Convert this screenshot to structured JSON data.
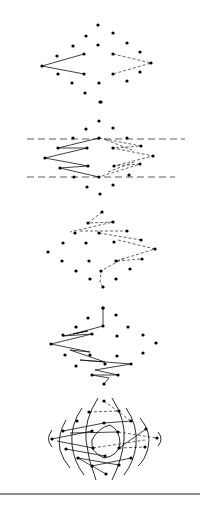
{
  "figure": {
    "dot_radius": 1.6,
    "ink_color": "#000000",
    "background": "#ffffff",
    "panels": [
      {
        "name": "panel-1",
        "dots": [
          [
            98,
            25
          ],
          [
            86,
            36
          ],
          [
            113,
            33
          ],
          [
            73,
            46
          ],
          [
            98,
            45
          ],
          [
            127,
            43
          ],
          [
            57,
            56
          ],
          [
            84,
            54
          ],
          [
            113,
            54
          ],
          [
            140,
            52
          ],
          [
            42,
            66
          ],
          [
            151,
            63
          ],
          [
            58,
            74
          ],
          [
            84,
            74
          ],
          [
            113,
            74
          ],
          [
            140,
            72
          ],
          [
            72,
            83
          ],
          [
            99,
            83
          ],
          [
            127,
            81
          ],
          [
            85,
            93
          ],
          [
            101,
            102
          ]
        ],
        "solid_paths": [
          [
            [
              84,
              54
            ],
            [
              42,
              66
            ],
            [
              84,
              74
            ]
          ]
        ],
        "dashed_paths": [
          [
            [
              113,
              54
            ],
            [
              151,
              63
            ],
            [
              113,
              74
            ]
          ]
        ],
        "long_dashed_lines": [],
        "arcs": []
      },
      {
        "name": "panel-2",
        "dots": [
          [
            100,
            102
          ],
          [
            99,
            121
          ],
          [
            86,
            129
          ],
          [
            113,
            128
          ],
          [
            73,
            138
          ],
          [
            99,
            138
          ],
          [
            127,
            138
          ],
          [
            58,
            148
          ],
          [
            87,
            148
          ],
          [
            113,
            148
          ],
          [
            141,
            146
          ],
          [
            45,
            158
          ],
          [
            153,
            156
          ],
          [
            60,
            168
          ],
          [
            88,
            166
          ],
          [
            114,
            166
          ],
          [
            140,
            164
          ],
          [
            74,
            177
          ],
          [
            99,
            177
          ],
          [
            129,
            175
          ],
          [
            87,
            187
          ],
          [
            113,
            185
          ],
          [
            100,
            194
          ]
        ],
        "solid_paths": [
          [
            [
              99,
              138
            ],
            [
              58,
              148
            ],
            [
              87,
              148
            ],
            [
              45,
              158
            ],
            [
              88,
              166
            ],
            [
              60,
              168
            ],
            [
              99,
              177
            ]
          ]
        ],
        "dashed_paths": [
          [
            [
              99,
              138
            ],
            [
              141,
              146
            ],
            [
              113,
              148
            ],
            [
              153,
              156
            ],
            [
              114,
              166
            ],
            [
              140,
              164
            ],
            [
              99,
              177
            ]
          ],
          [
            [
              106,
              140
            ],
            [
              132,
              150
            ]
          ],
          [
            [
              108,
              172
            ],
            [
              134,
              162
            ]
          ]
        ],
        "long_dashed_lines": [
          [
            [
              27,
              139
            ],
            [
              185,
              139
            ]
          ],
          [
            [
              27,
              177
            ],
            [
              175,
              177
            ]
          ]
        ],
        "arcs": []
      },
      {
        "name": "panel-3",
        "dots": [
          [
            102,
            212
          ],
          [
            88,
            223
          ],
          [
            113,
            222
          ],
          [
            75,
            233
          ],
          [
            99,
            233
          ],
          [
            127,
            231
          ],
          [
            63,
            243
          ],
          [
            86,
            243
          ],
          [
            114,
            242
          ],
          [
            141,
            240
          ],
          [
            48,
            252
          ],
          [
            155,
            249
          ],
          [
            62,
            261
          ],
          [
            89,
            261
          ],
          [
            116,
            261
          ],
          [
            142,
            259
          ],
          [
            76,
            271
          ],
          [
            101,
            271
          ],
          [
            130,
            269
          ],
          [
            90,
            279
          ],
          [
            116,
            279
          ],
          [
            103,
            287
          ],
          [
            103,
            308
          ]
        ],
        "solid_paths": [],
        "dashed_paths": [
          [
            [
              102,
              212
            ],
            [
              88,
              223
            ],
            [
              113,
              222
            ],
            [
              70,
              232
            ]
          ],
          [
            [
              80,
              231
            ],
            [
              127,
              231
            ]
          ],
          [
            [
              99,
              233
            ],
            [
              141,
              240
            ]
          ],
          [
            [
              118,
              240
            ],
            [
              155,
              249
            ],
            [
              116,
              261
            ],
            [
              142,
              259
            ]
          ],
          [
            [
              124,
              258
            ],
            [
              101,
              271
            ],
            [
              100,
              282
            ],
            [
              103,
              287
            ]
          ]
        ],
        "long_dashed_lines": [],
        "arcs": []
      },
      {
        "name": "panel-4",
        "dots": [
          [
            103,
            308
          ],
          [
            88,
            318
          ],
          [
            116,
            315
          ],
          [
            76,
            327
          ],
          [
            103,
            326
          ],
          [
            128,
            327
          ],
          [
            63,
            335
          ],
          [
            92,
            334
          ],
          [
            117,
            336
          ],
          [
            143,
            335
          ],
          [
            51,
            344
          ],
          [
            156,
            343
          ],
          [
            65,
            355
          ],
          [
            90,
            355
          ],
          [
            117,
            356
          ],
          [
            143,
            353
          ],
          [
            76,
            366
          ],
          [
            105,
            364
          ],
          [
            131,
            364
          ],
          [
            92,
            375
          ],
          [
            118,
            375
          ],
          [
            104,
            384
          ]
        ],
        "solid_paths": [
          [
            [
              103,
              308
            ],
            [
              103,
              326
            ],
            [
              73,
              334
            ],
            [
              88,
              331
            ],
            [
              63,
              336
            ],
            [
              92,
              334
            ],
            [
              51,
              344
            ],
            [
              90,
              352
            ],
            [
              70,
              350
            ],
            [
              105,
              362
            ],
            [
              80,
              360
            ],
            [
              131,
              364
            ],
            [
              95,
              370
            ],
            [
              118,
              375
            ],
            [
              92,
              375
            ],
            [
              109,
              378
            ],
            [
              104,
              384
            ]
          ]
        ],
        "dashed_paths": [],
        "long_dashed_lines": [],
        "arcs": []
      },
      {
        "name": "panel-5",
        "dots": [
          [
            104,
            401
          ],
          [
            89,
            412
          ],
          [
            119,
            411
          ],
          [
            77,
            421
          ],
          [
            104,
            423
          ],
          [
            131,
            421
          ],
          [
            63,
            431
          ],
          [
            92,
            431
          ],
          [
            118,
            432
          ],
          [
            146,
            429
          ],
          [
            52,
            439
          ],
          [
            157,
            438
          ],
          [
            66,
            449
          ],
          [
            93,
            448
          ],
          [
            119,
            448
          ],
          [
            145,
            447
          ],
          [
            78,
            458
          ],
          [
            105,
            456
          ],
          [
            131,
            458
          ],
          [
            92,
            466
          ],
          [
            119,
            465
          ],
          [
            106,
            474
          ]
        ],
        "solid_paths": [
          [
            [
              52,
              439
            ],
            [
              92,
              431
            ]
          ],
          [
            [
              63,
              431
            ],
            [
              104,
              423
            ]
          ],
          [
            [
              66,
              449
            ],
            [
              105,
              456
            ]
          ],
          [
            [
              78,
              458
            ],
            [
              119,
              465
            ]
          ],
          [
            [
              92,
              466
            ],
            [
              131,
              458
            ]
          ],
          [
            [
              57,
              441
            ],
            [
              93,
              448
            ]
          ],
          [
            [
              78,
              458
            ],
            [
              106,
              474
            ]
          ],
          [
            [
              70,
              433
            ],
            [
              118,
              432
            ]
          ],
          [
            [
              104,
              423
            ],
            [
              131,
              421
            ]
          ],
          [
            [
              119,
              448
            ],
            [
              146,
              429
            ]
          ]
        ],
        "dashed_paths": [
          [
            [
              89,
              412
            ],
            [
              119,
              411
            ]
          ],
          [
            [
              104,
              401
            ],
            [
              131,
              421
            ]
          ],
          [
            [
              118,
              432
            ],
            [
              157,
              438
            ]
          ],
          [
            [
              119,
              448
            ],
            [
              145,
              447
            ]
          ],
          [
            [
              93,
              448
            ],
            [
              145,
              440
            ]
          ]
        ],
        "long_dashed_lines": [],
        "arcs": [
          "M 98 398 Q 84 420 86 440 Q 88 460 96 480",
          "M 82 408 Q 70 425 72 445 Q 74 462 84 475",
          "M 66 420 Q 57 435 60 450 Q 63 460 70 468",
          "M 52 430 Q 45 439 52 447",
          "M 112 398 Q 126 420 124 440 Q 122 460 112 480",
          "M 126 408 Q 138 425 136 445 Q 134 462 124 475",
          "M 140 418 Q 152 432 148 448 Q 145 460 138 466",
          "M 158 432 Q 164 439 158 446",
          "M 110 425 Q 98 428 92 440 Q 90 452 104 458 Q 118 456 120 444 Q 120 430 110 425"
        ]
      }
    ],
    "bottom_rule": {
      "y": 494,
      "x1": 0,
      "x2": 200
    }
  }
}
